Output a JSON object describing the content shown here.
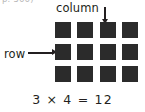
{
  "figure": {
    "page_reference": "p. 566)",
    "labels": {
      "column": "column",
      "row": "row"
    },
    "icons": {
      "column_pointer": "arrow-down-icon",
      "row_pointer": "arrow-right-icon"
    },
    "equation": "3 × 4 = 12",
    "colors": {
      "background": "#ffffff",
      "square": "#2b2b2b",
      "text": "#231f20",
      "page_reference": "#b9b9b9"
    }
  },
  "chart_data": {
    "type": "table",
    "title": "3 × 4 = 12",
    "rows": 3,
    "columns": 4,
    "total": 12,
    "cells": [
      [
        "square",
        "square",
        "square",
        "square"
      ],
      [
        "square",
        "square",
        "square",
        "square"
      ],
      [
        "square",
        "square",
        "square",
        "square"
      ]
    ],
    "annotations": [
      {
        "text": "column",
        "points_to": "column-3",
        "direction": "down"
      },
      {
        "text": "row",
        "points_to": "row-2",
        "direction": "right"
      }
    ]
  }
}
